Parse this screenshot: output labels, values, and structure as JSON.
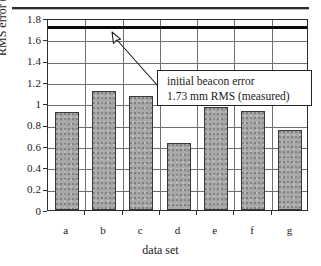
{
  "figure": {
    "top_rule": "scan-rule"
  },
  "chart_data": {
    "type": "bar",
    "title": "",
    "xlabel": "data set",
    "ylabel": "RMS error (millimeters)",
    "categories": [
      "a",
      "b",
      "c",
      "d",
      "e",
      "f",
      "g"
    ],
    "values": [
      0.92,
      1.12,
      1.07,
      0.63,
      0.97,
      0.93,
      0.755
    ],
    "ylim": [
      0,
      1.8
    ],
    "yticks": [
      "0",
      "0.2",
      "0.4",
      "0.6",
      "0.8",
      "1",
      "1.2",
      "1.4",
      "1.6",
      "1.8"
    ],
    "ytick_values": [
      0,
      0.2,
      0.4,
      0.6,
      0.8,
      1.0,
      1.2,
      1.4,
      1.6,
      1.8
    ],
    "grid": true,
    "legend": "none",
    "bar_color": "#a9a9a9",
    "bar_edge_color": "#3a3a3a",
    "annotations": [
      {
        "name": "initial-beacon-error",
        "line1": "initial beacon error",
        "line2": "1.73 mm RMS (measured)",
        "reference_value": 1.73,
        "reference_line_color": "#0b0b0b"
      }
    ]
  },
  "yticks": {
    "t0": "0",
    "t1": "0.2",
    "t2": "0.4",
    "t3": "0.6",
    "t4": "0.8",
    "t5": "1",
    "t6": "1.2",
    "t7": "1.4",
    "t8": "1.6",
    "t9": "1.8"
  },
  "xticks": {
    "t0": "a",
    "t1": "b",
    "t2": "c",
    "t3": "d",
    "t4": "e",
    "t5": "f",
    "t6": "g"
  },
  "axis_titles": {
    "y": "RMS error (millimeters)",
    "x": "data set"
  },
  "callout": {
    "line1": "initial beacon error",
    "line2": "1.73 mm RMS (measured)"
  }
}
